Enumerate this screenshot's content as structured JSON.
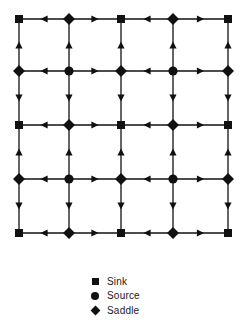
{
  "diagram": {
    "title": "",
    "grid": {
      "rows": 5,
      "cols": 5,
      "x": [
        19,
        69,
        121,
        173,
        228
      ],
      "y": [
        19,
        71,
        125,
        179,
        233
      ]
    },
    "nodes": [
      [
        "sink",
        "saddle",
        "sink",
        "saddle",
        "sink"
      ],
      [
        "saddle",
        "source",
        "saddle",
        "source",
        "saddle"
      ],
      [
        "sink",
        "saddle",
        "sink",
        "saddle",
        "sink"
      ],
      [
        "saddle",
        "source",
        "saddle",
        "source",
        "saddle"
      ],
      [
        "sink",
        "saddle",
        "sink",
        "saddle",
        "sink"
      ]
    ],
    "horizontal_arrows": [
      [
        "left",
        "right",
        "left",
        "right"
      ],
      [
        "left",
        "right",
        "left",
        "right"
      ],
      [
        "left",
        "right",
        "left",
        "right"
      ],
      [
        "left",
        "right",
        "left",
        "right"
      ],
      [
        "left",
        "right",
        "left",
        "right"
      ]
    ],
    "vertical_arrows": [
      [
        "up",
        "up",
        "up",
        "up",
        "up"
      ],
      [
        "down",
        "down",
        "down",
        "down",
        "down"
      ],
      [
        "up",
        "up",
        "up",
        "up",
        "up"
      ],
      [
        "down",
        "down",
        "down",
        "down",
        "down"
      ]
    ],
    "colors": {
      "ink": "#111111",
      "background": "#ffffff"
    }
  },
  "legend": {
    "items": [
      {
        "symbol": "square",
        "label": "Sink"
      },
      {
        "symbol": "circle",
        "label": "Source"
      },
      {
        "symbol": "diamond",
        "label": "Saddle"
      }
    ]
  }
}
